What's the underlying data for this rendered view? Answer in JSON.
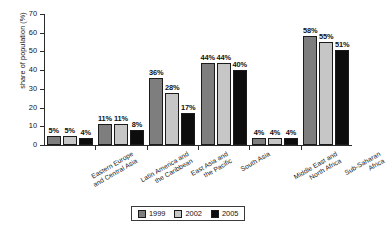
{
  "chart_data": {
    "type": "bar",
    "title": "",
    "xlabel": "",
    "ylabel": "share of population (%)",
    "ylim": [
      0,
      70
    ],
    "yticks": [
      0,
      10,
      20,
      30,
      40,
      50,
      60,
      70
    ],
    "grid": false,
    "legend_position": "bottom-center",
    "value_suffix": "%",
    "categories": [
      "Eastern Europe and Central Asia",
      "Latin America and the Caribbean",
      "East Asia and the Pacific",
      "South Asia",
      "Middle East and North Africa",
      "Sub-Saharan Africa"
    ],
    "category_lines": [
      [
        "Eastern Europe",
        "and Central Asia"
      ],
      [
        "Latin America and",
        "the Caribbean"
      ],
      [
        "East Asia and",
        "the Pacific"
      ],
      [
        "South Asia"
      ],
      [
        "Middle East and",
        "North Africa"
      ],
      [
        "Sub-Saharan",
        "Africa"
      ]
    ],
    "series": [
      {
        "name": "1999",
        "color": "#7e7e7e",
        "values": [
          5,
          11,
          36,
          44,
          4,
          58
        ]
      },
      {
        "name": "2002",
        "color": "#c6c6c6",
        "values": [
          5,
          11,
          28,
          44,
          4,
          55
        ]
      },
      {
        "name": "2005",
        "color": "#0d0d0d",
        "values": [
          4,
          8,
          17,
          40,
          4,
          51
        ]
      }
    ],
    "data_labels": [
      [
        "5%",
        "5%",
        "4%"
      ],
      [
        "11%",
        "11%",
        "8%"
      ],
      [
        "36%",
        "28%",
        "17%"
      ],
      [
        "44%",
        "44%",
        "40%"
      ],
      [
        "4%",
        "4%",
        "4%"
      ],
      [
        "58%",
        "55%",
        "51%"
      ]
    ]
  },
  "legend": {
    "items": [
      {
        "label": "1999"
      },
      {
        "label": "2002"
      },
      {
        "label": "2005"
      }
    ]
  },
  "axis": {
    "y_label": "share of population (%)",
    "y_tick_labels": [
      "0",
      "10",
      "20",
      "30",
      "40",
      "50",
      "60",
      "70"
    ]
  }
}
